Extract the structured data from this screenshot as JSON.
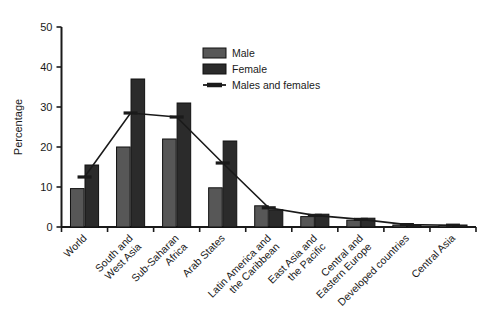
{
  "chart_data": {
    "type": "bar",
    "title": "",
    "xlabel": "",
    "ylabel": "Percentage",
    "ylim": [
      0,
      50
    ],
    "yticks": [
      0,
      10,
      20,
      30,
      40,
      50
    ],
    "ytick_labels": [
      "0",
      "10",
      "20",
      "30",
      "40",
      "50"
    ],
    "grid": false,
    "legend_position": "top-right",
    "categories": [
      "World",
      "South and West Asia",
      "Sub-Saharan Africa",
      "Arab States",
      "Latin America and the Caribbean",
      "East Asia and the Pacific",
      "Central and Eastern Europe",
      "Developed countries",
      "Central Asia"
    ],
    "category_lines": [
      [
        "World"
      ],
      [
        "South and",
        "West Asia"
      ],
      [
        "Sub-Saharan",
        "Africa"
      ],
      [
        "Arab States"
      ],
      [
        "Latin America and",
        "the Caribbean"
      ],
      [
        "East Asia and",
        "the Pacific"
      ],
      [
        "Central and",
        "Eastern Europe"
      ],
      [
        "Developed countries"
      ],
      [
        "Central Asia"
      ]
    ],
    "series": [
      {
        "name": "Male",
        "kind": "bar",
        "color": "#575757",
        "values": [
          9.6,
          20.0,
          22.0,
          9.8,
          5.3,
          2.6,
          1.7,
          0.5,
          0.4
        ]
      },
      {
        "name": "Female",
        "kind": "bar",
        "color": "#2b2b2b",
        "values": [
          15.5,
          37.0,
          31.0,
          21.5,
          4.3,
          3.2,
          2.2,
          0.6,
          0.5
        ]
      },
      {
        "name": "Males and females",
        "kind": "line",
        "color": "#1a1a1a",
        "values": [
          12.5,
          28.5,
          27.5,
          16.0,
          4.8,
          2.9,
          1.9,
          0.6,
          0.45
        ]
      }
    ]
  },
  "legend": {
    "items": [
      {
        "label": "Male",
        "marker": "swatch",
        "color": "#575757"
      },
      {
        "label": "Female",
        "marker": "swatch",
        "color": "#2b2b2b"
      },
      {
        "label": "Males and females",
        "marker": "line",
        "color": "#1a1a1a"
      }
    ]
  },
  "axes": {
    "y_title": "Percentage"
  }
}
